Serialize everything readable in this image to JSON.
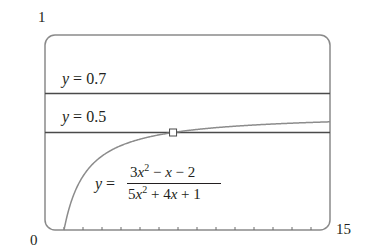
{
  "chart_data": {
    "type": "line",
    "title": "",
    "xlabel": "",
    "ylabel": "",
    "xlim": [
      0,
      15
    ],
    "ylim": [
      0,
      1
    ],
    "x_tick_labels": [
      "0",
      "15"
    ],
    "y_tick_labels": [
      "0",
      "1"
    ],
    "x_ticks": [
      1,
      2,
      3,
      4,
      5,
      6,
      7,
      8,
      9,
      10,
      11,
      12,
      13,
      14
    ],
    "grid": false,
    "legend": null,
    "series": [
      {
        "name": "y = (3x^2 - x - 2)/(5x^2 + 4x + 1)",
        "kind": "curve",
        "x": [
          1,
          1.5,
          2,
          2.5,
          3,
          4,
          5,
          6,
          6.74,
          8,
          10,
          12,
          15
        ],
        "values": [
          0.0,
          0.1765,
          0.2667,
          0.3191,
          0.3529,
          0.3926,
          0.4133,
          0.4258,
          0.5,
          0.5156,
          0.5286,
          0.5374,
          0.5548
        ]
      },
      {
        "name": "y = 0.7",
        "kind": "hline",
        "value": 0.7
      },
      {
        "name": "y = 0.5",
        "kind": "hline",
        "value": 0.5
      }
    ],
    "annotations": [
      {
        "type": "marker",
        "shape": "square",
        "x": 6.74,
        "y": 0.5,
        "note": "intersection of curve and y = 0.5"
      },
      {
        "type": "text",
        "text": "y = 0.7"
      },
      {
        "type": "text",
        "text": "y = 0.5"
      },
      {
        "type": "text",
        "text": "y = (3x^2 - x - 2)/(5x^2 + 4x + 1)"
      }
    ]
  },
  "labels": {
    "y_top": "1",
    "origin": "0",
    "x_right": "15",
    "line_07": {
      "var": "y",
      "eq": " = 0.7"
    },
    "line_05": {
      "var": "y",
      "eq": " = 0.5"
    },
    "formula": {
      "lhs_var": "y",
      "lhs_eq": " =",
      "num": {
        "c1": "3",
        "v1": "x",
        "e1": "2",
        "rest": " − ",
        "v2": "x",
        "tail": " − 2"
      },
      "den": {
        "c1": "5",
        "v1": "x",
        "e1": "2",
        "rest": " + 4",
        "v2": "x",
        "tail": " + 1"
      }
    }
  },
  "colors": {
    "frame": "#8a8a8a",
    "hline": "#4a4a4a",
    "curve": "#8c8c8c",
    "text": "#231f20"
  }
}
